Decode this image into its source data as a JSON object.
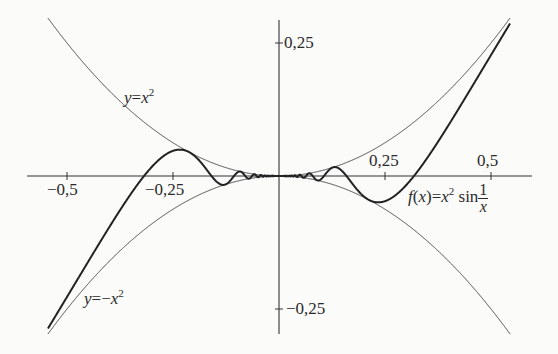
{
  "chart_data": {
    "type": "line",
    "title": "",
    "xlabel": "",
    "ylabel": "",
    "xlim": [
      -0.56,
      0.6
    ],
    "ylim": [
      -0.3,
      0.3
    ],
    "grid": false,
    "legend": null,
    "x_ticks": [
      -0.5,
      -0.25,
      0.25,
      0.5
    ],
    "x_tick_labels": [
      "−0,5",
      "−0,25",
      "0,25",
      "0,5"
    ],
    "y_ticks": [
      0.25,
      -0.25
    ],
    "y_tick_labels": [
      "0,25",
      "−0,25"
    ],
    "series": [
      {
        "name": "y=x^2",
        "expr": "x^2",
        "domain": [
          -0.545,
          0.545
        ],
        "style": "thin"
      },
      {
        "name": "y=-x^2",
        "expr": "-x^2",
        "domain": [
          -0.545,
          0.545
        ],
        "style": "thin"
      },
      {
        "name": "f(x)=x^2 sin(1/x)",
        "expr": "x^2*sin(1/x)",
        "domain": [
          -0.545,
          0.545
        ],
        "style": "thick"
      }
    ],
    "annotations": [
      {
        "text": "y=x²",
        "x": -0.28,
        "y": 0.19
      },
      {
        "text": "y=−x²",
        "x": -0.47,
        "y": -0.2
      },
      {
        "text": "f(x)=x² sin 1/x",
        "x": 0.3,
        "y": -0.06
      }
    ]
  },
  "labels": {
    "x_ticks": [
      "−0,5",
      "−0,25",
      "0,25",
      "0,5"
    ],
    "y_pos": "0,25",
    "y_neg": "−0,25",
    "parabola_up": {
      "y": "y",
      "eq": "=",
      "x": "x",
      "exp": "2"
    },
    "parabola_down": {
      "y": "y",
      "eq": "=−",
      "x": "x",
      "exp": "2"
    },
    "func": {
      "f": "f",
      "open": "(",
      "x": "x",
      "close": ")",
      "eq": "=",
      "x2": "x",
      "exp": "2",
      "sin": "sin",
      "num": "1",
      "den": "x"
    }
  }
}
